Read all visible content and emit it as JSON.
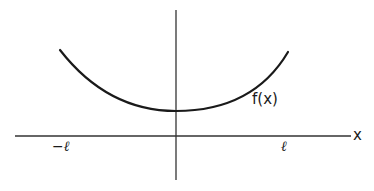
{
  "figure": {
    "type": "function-graph",
    "curve_label": "f(x)",
    "x_axis_label": "x",
    "tick_labels": {
      "left": "−ℓ",
      "right": "ℓ"
    },
    "colors": {
      "background": "#ffffff",
      "ink": "#1a1a1a"
    }
  },
  "geometry": {
    "x_axis": {
      "x1": 15,
      "x2": 351,
      "y": 136
    },
    "y_axis": {
      "x": 176,
      "y1": 10,
      "y2": 180
    },
    "curve": {
      "start": [
        60,
        50
      ],
      "minimum": [
        176,
        111
      ],
      "end": [
        288,
        52
      ]
    }
  }
}
